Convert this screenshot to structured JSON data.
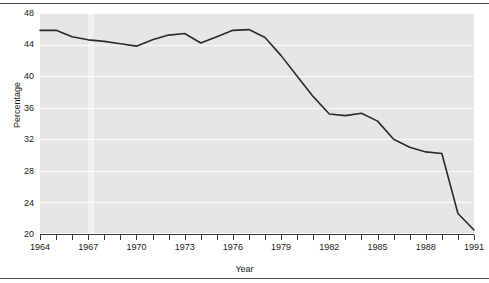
{
  "chart_data": {
    "type": "line",
    "title": "",
    "subtitle": "",
    "xlabel": "Year",
    "ylabel": "Percentage",
    "xlim": [
      1964,
      1991
    ],
    "ylim": [
      20,
      48
    ],
    "yticks": [
      20,
      24,
      28,
      32,
      36,
      40,
      44,
      48
    ],
    "ytick_labels": [
      "20",
      "24",
      "28",
      "32",
      "36",
      "40",
      "44",
      "48"
    ],
    "xticks": [
      1964,
      1965,
      1966,
      1967,
      1968,
      1969,
      1970,
      1971,
      1972,
      1973,
      1974,
      1975,
      1976,
      1977,
      1978,
      1979,
      1980,
      1981,
      1982,
      1983,
      1984,
      1985,
      1986,
      1987,
      1988,
      1989,
      1990,
      1991
    ],
    "xtick_labels_shown": [
      "1964",
      "1967",
      "1970",
      "1973",
      "1976",
      "1979",
      "1982",
      "1985",
      "1988",
      "1991"
    ],
    "xtick_label_interval": 3,
    "grid": true,
    "grid_axis": "y",
    "grid_color": "#fbfbfb",
    "panel_background": "#e6e6e6",
    "line_color": "#2b2b2b",
    "line_width": 1.6,
    "legend": null,
    "legend_position": "none",
    "series": [
      {
        "name": "Percentage",
        "x": [
          1964,
          1965,
          1966,
          1967,
          1968,
          1969,
          1970,
          1971,
          1972,
          1973,
          1974,
          1975,
          1976,
          1977,
          1978,
          1979,
          1980,
          1981,
          1982,
          1983,
          1984,
          1985,
          1986,
          1987,
          1988,
          1989,
          1990,
          1991
        ],
        "values": [
          45.8,
          45.8,
          45.0,
          44.6,
          44.4,
          44.1,
          43.8,
          44.6,
          45.2,
          45.4,
          44.2,
          45.0,
          45.8,
          45.9,
          44.9,
          42.6,
          40.0,
          37.4,
          35.2,
          35.0,
          35.3,
          34.3,
          32.0,
          31.0,
          30.4,
          30.2,
          22.6,
          20.5
        ]
      }
    ]
  },
  "axis": {
    "y_title": "Percentage",
    "x_title": "Year"
  }
}
